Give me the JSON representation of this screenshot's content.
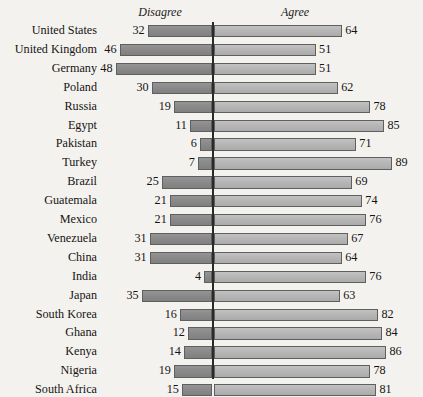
{
  "chart_data": {
    "type": "bar",
    "subtype": "diverging-bar",
    "title": "",
    "xlabel": "",
    "ylabel": "",
    "headers": {
      "left": "Disagree",
      "right": "Agree"
    },
    "categories": [
      "United States",
      "United Kingdom",
      "Germany",
      "Poland",
      "Russia",
      "Egypt",
      "Pakistan",
      "Turkey",
      "Brazil",
      "Guatemala",
      "Mexico",
      "Venezuela",
      "China",
      "India",
      "Japan",
      "South Korea",
      "Ghana",
      "Kenya",
      "Nigeria",
      "South Africa"
    ],
    "series": [
      {
        "name": "Disagree",
        "color": "#8a8a8a",
        "direction": "left",
        "values": [
          32,
          46,
          48,
          30,
          19,
          11,
          6,
          7,
          25,
          21,
          21,
          31,
          31,
          4,
          35,
          16,
          12,
          14,
          19,
          15
        ]
      },
      {
        "name": "Agree",
        "color": "#b6b6b6",
        "direction": "right",
        "values": [
          64,
          51,
          51,
          62,
          78,
          85,
          71,
          89,
          69,
          74,
          76,
          67,
          64,
          76,
          63,
          82,
          84,
          86,
          78,
          81
        ]
      }
    ],
    "scale": {
      "px_per_unit": 2.01,
      "axis_x_px": 212,
      "row_pitch_px": 18.9,
      "first_row_top_px": 25,
      "bar_height_px": 12.4
    },
    "grid": false,
    "legend": "none",
    "axis_range": [
      0,
      100
    ]
  }
}
